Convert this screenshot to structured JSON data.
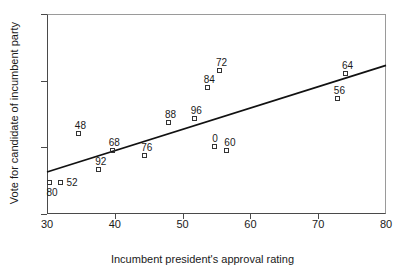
{
  "chart_data": {
    "type": "scatter",
    "title": "",
    "xlabel": "Incumbent president's approval rating",
    "ylabel": "Vote for candidate of incumbent party",
    "xlim": [
      30,
      80
    ],
    "ylim": [
      40,
      70
    ],
    "xticks": [
      30,
      40,
      50,
      60,
      70,
      80
    ],
    "yticks": [
      40,
      50,
      60,
      70
    ],
    "grid": false,
    "legend": false,
    "marker_style": "open-square",
    "point_label_field": "label",
    "points": [
      {
        "label": "80",
        "x": 30.5,
        "y": 44.6,
        "label_dx": -4,
        "label_dy": 12
      },
      {
        "label": "52",
        "x": 32.0,
        "y": 44.6,
        "label_dx": 6,
        "label_dy": 2
      },
      {
        "label": "92",
        "x": 37.7,
        "y": 46.6,
        "label_dx": -4,
        "label_dy": -6
      },
      {
        "label": "48",
        "x": 34.7,
        "y": 52.0,
        "label_dx": -4,
        "label_dy": -6
      },
      {
        "label": "68",
        "x": 39.7,
        "y": 49.5,
        "label_dx": -4,
        "label_dy": -6
      },
      {
        "label": "76",
        "x": 44.5,
        "y": 48.7,
        "label_dx": -4,
        "label_dy": -6
      },
      {
        "label": "88",
        "x": 48.0,
        "y": 53.6,
        "label_dx": -4,
        "label_dy": -6
      },
      {
        "label": "96",
        "x": 51.8,
        "y": 54.2,
        "label_dx": -4,
        "label_dy": -6
      },
      {
        "label": "84",
        "x": 53.7,
        "y": 58.9,
        "label_dx": -4,
        "label_dy": -6
      },
      {
        "label": "0",
        "x": 54.8,
        "y": 50.0,
        "label_dx": -3,
        "label_dy": -6
      },
      {
        "label": "72",
        "x": 55.5,
        "y": 61.4,
        "label_dx": -4,
        "label_dy": -6
      },
      {
        "label": "60",
        "x": 56.6,
        "y": 49.5,
        "label_dx": -3,
        "label_dy": -6
      },
      {
        "label": "56",
        "x": 72.9,
        "y": 57.3,
        "label_dx": -4,
        "label_dy": -6
      },
      {
        "label": "64",
        "x": 74.1,
        "y": 61.0,
        "label_dx": -4,
        "label_dy": -6
      }
    ],
    "trendline": {
      "x_start": 30,
      "y_start": 46.3,
      "x_end": 80,
      "y_end": 62.3,
      "color": "#111111",
      "width": 1.8
    },
    "axis_color": "#4a4a4a",
    "frame_color": "#9a9a9a",
    "marker_color": "#333333"
  }
}
